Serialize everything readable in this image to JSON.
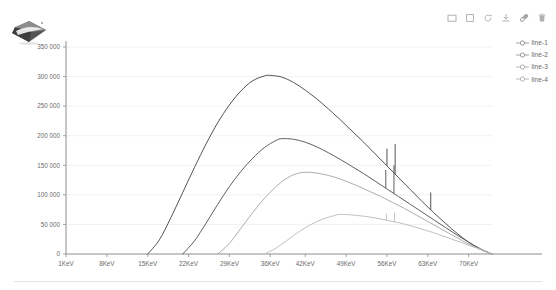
{
  "toolbar": {
    "items": [
      {
        "name": "rect-select-icon",
        "title": "Rectangle select"
      },
      {
        "name": "square-zoom-icon",
        "title": "Zoom region"
      },
      {
        "name": "restore-icon",
        "title": "Restore"
      },
      {
        "name": "download-icon",
        "title": "Download"
      },
      {
        "name": "link-icon",
        "title": "Link"
      },
      {
        "name": "trash-icon",
        "title": "Delete"
      }
    ]
  },
  "legend": {
    "position": "top-right",
    "items": [
      {
        "label": "line-1",
        "color": "#4a4a4a"
      },
      {
        "label": "line-2",
        "color": "#565656"
      },
      {
        "label": "line-3",
        "color": "#a8a8a8"
      },
      {
        "label": "line-4",
        "color": "#bdbdbd"
      }
    ]
  },
  "chart_data": {
    "type": "line",
    "title": "",
    "xlabel": "",
    "ylabel": "",
    "grid": true,
    "xlim": [
      1,
      74
    ],
    "ylim": [
      0,
      350000
    ],
    "xtick_labels": [
      "1KeV",
      "8KeV",
      "15KeV",
      "22KeV",
      "29KeV",
      "36KeV",
      "42KeV",
      "49KeV",
      "56KeV",
      "63KeV",
      "70KeV"
    ],
    "xtick_values": [
      1,
      8,
      15,
      22,
      29,
      36,
      42,
      49,
      56,
      63,
      70
    ],
    "ytick_labels": [
      "0",
      "50 000",
      "100 000",
      "150 000",
      "200 000",
      "250 000",
      "300 000",
      "350 000"
    ],
    "ytick_values": [
      0,
      50000,
      100000,
      150000,
      200000,
      250000,
      300000,
      350000
    ],
    "series": [
      {
        "name": "line-1",
        "color": "#4a4a4a",
        "peak_x": 36,
        "peak_y": 302000,
        "onset_x": 15,
        "end_x": 74,
        "x": [
          15,
          17,
          19,
          21,
          23,
          25,
          27,
          29,
          31,
          33,
          35,
          36,
          38,
          40,
          42,
          44,
          46,
          48,
          50,
          52,
          54,
          56,
          58,
          60,
          62,
          64,
          66,
          68,
          70,
          72,
          74
        ],
        "y": [
          0,
          24000,
          62000,
          104000,
          146000,
          186000,
          222000,
          252000,
          276000,
          293000,
          301000,
          302000,
          299000,
          290000,
          277000,
          262000,
          245000,
          227000,
          208000,
          189000,
          169000,
          149000,
          129000,
          109000,
          89000,
          70000,
          52000,
          35000,
          20000,
          8000,
          0
        ],
        "spikes": [
          {
            "x": 56.0,
            "y_top": 178000
          },
          {
            "x": 57.4,
            "y_top": 186000
          },
          {
            "x": 63.5,
            "y_top": 104000
          }
        ]
      },
      {
        "name": "line-2",
        "color": "#565656",
        "peak_x": 38,
        "peak_y": 195000,
        "onset_x": 21,
        "end_x": 74,
        "x": [
          21,
          23,
          25,
          27,
          29,
          31,
          33,
          35,
          37,
          38,
          40,
          42,
          44,
          46,
          48,
          50,
          52,
          54,
          56,
          58,
          60,
          62,
          64,
          66,
          68,
          70,
          72,
          74
        ],
        "y": [
          0,
          22000,
          52000,
          84000,
          114000,
          140000,
          162000,
          180000,
          192000,
          195000,
          194000,
          189000,
          181000,
          171000,
          160000,
          148000,
          136000,
          123000,
          110000,
          97000,
          84000,
          71000,
          58000,
          45000,
          32000,
          20000,
          9000,
          0
        ],
        "spikes": [
          {
            "x": 55.8,
            "y_top": 142000
          },
          {
            "x": 57.2,
            "y_top": 150000
          }
        ]
      },
      {
        "name": "line-3",
        "color": "#a8a8a8",
        "peak_x": 41,
        "peak_y": 138000,
        "onset_x": 27,
        "end_x": 74,
        "x": [
          27,
          29,
          31,
          33,
          35,
          37,
          39,
          41,
          43,
          45,
          47,
          49,
          51,
          53,
          55,
          57,
          59,
          61,
          63,
          65,
          67,
          69,
          71,
          74
        ],
        "y": [
          0,
          18000,
          44000,
          70000,
          94000,
          114000,
          129000,
          137000,
          138000,
          135000,
          130000,
          123000,
          115000,
          106000,
          97000,
          87000,
          77000,
          66000,
          55000,
          44000,
          33000,
          22000,
          12000,
          0
        ],
        "spikes": []
      },
      {
        "name": "line-4",
        "color": "#bdbdbd",
        "peak_x": 48,
        "peak_y": 67000,
        "onset_x": 35,
        "end_x": 74,
        "x": [
          35,
          37,
          39,
          41,
          43,
          45,
          47,
          48,
          50,
          52,
          54,
          56,
          58,
          60,
          62,
          64,
          66,
          68,
          70,
          72,
          74
        ],
        "y": [
          0,
          10000,
          24000,
          38000,
          50000,
          59000,
          65000,
          67000,
          66000,
          64000,
          61000,
          57000,
          53000,
          48000,
          42000,
          36000,
          29000,
          22000,
          15000,
          8000,
          0
        ],
        "spikes": [
          {
            "x": 55.9,
            "y_top": 68000
          },
          {
            "x": 57.3,
            "y_top": 70000
          }
        ]
      }
    ]
  }
}
